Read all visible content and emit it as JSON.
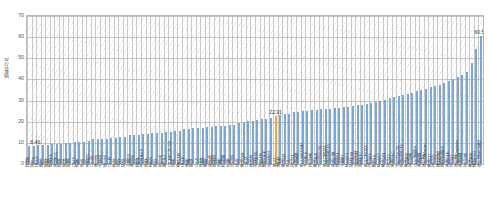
{
  "chart_data": {
    "type": "bar",
    "title": "",
    "xlabel": "",
    "ylabel": "销售万元",
    "ylim": [
      0,
      70
    ],
    "yticks": [
      0,
      10,
      20,
      30,
      40,
      50,
      60,
      70
    ],
    "grid": true,
    "legend": null,
    "bar_color": "#7ba7d7",
    "highlight_color": "#f0a24a",
    "highlight_index": 54,
    "annotations": [
      {
        "index": 0,
        "text": "8.46",
        "value": 8.46
      },
      {
        "index": 54,
        "text": "22.91",
        "value": 22.91
      },
      {
        "index": 99,
        "text": "60.50",
        "value": 60.5
      }
    ],
    "categories": [
      "瑞虎8",
      "宋Pro",
      "UNI-V",
      "朗逸",
      "缤智",
      "哈弗H6",
      "荣威RX5",
      "博越",
      "思域",
      "轩逸",
      "CS75",
      "逍客",
      "途岳",
      "名爵ZS",
      "CX-30",
      "锋兰达",
      "卡罗拉",
      "威兰达",
      "CH-R",
      "奕泽",
      "探影",
      "悦动",
      "小鹏G3",
      "领克06",
      "星越L",
      "长安UNI-T",
      "帝豪",
      "RAV4",
      "皓影",
      "高尔夫",
      "智己L7",
      "CS AIPCPCSS",
      "宝来",
      "秦PLUS",
      "UNI-K",
      "速腾",
      "明锐",
      "CX-5",
      "途观L",
      "雅阁",
      "帕萨特",
      "凯美瑞",
      "迈腾",
      "昂科威",
      "天籁",
      "汉兰达",
      "探岳",
      "奥迪Q2L",
      "CR-V",
      "亚洲龙",
      "蔚来ES6",
      "宋PLUS",
      "理想ONE",
      "比亚迪汉",
      "ID.4X",
      "唐DM",
      "奥迪Q3",
      "ID.3",
      "宝马X1",
      "奔驰A级",
      "ID.7 VIZZION",
      "大众ID.6",
      "宝马3系",
      "奥迪A4L",
      "沃尔沃XC60",
      "ID.6 CROZZ",
      "凯迪拉克CT5",
      "奔驰C级",
      "极氪001",
      "小鹏P7",
      "Model 3",
      "蔚来ES8",
      "比亚迪唐",
      "蔚来ET7",
      "ID.4 CROZZ",
      "宝马iX3",
      "理想L9",
      "Model Y",
      "奥迪Q5L",
      "宝马X3",
      "奔驰GLC",
      "沃尔沃XC90",
      "凯迪拉克CT6",
      "奥迪A6L",
      "宝马5系",
      "CLS 轿跑车",
      "奔驰E级",
      "保时捷Macan",
      "奥迪Q7",
      "宝马X5",
      "路虎揽胜",
      "雷克萨斯ES",
      "奔驰GLE",
      "宝马X7",
      "保时捷Cayenne",
      "奔驰S级",
      "宝马7系",
      "奥迪A8L",
      "路虎卫士",
      "保时捷帕拉梅拉"
    ],
    "values": [
      8.46,
      8.6,
      8.8,
      8.95,
      9.1,
      9.3,
      9.5,
      9.7,
      9.85,
      10.0,
      10.2,
      10.4,
      10.6,
      10.8,
      11.6,
      11.75,
      11.9,
      12.05,
      12.2,
      12.4,
      12.55,
      12.7,
      13.5,
      13.7,
      13.9,
      14.1,
      14.3,
      14.5,
      14.7,
      14.9,
      15.1,
      15.3,
      15.5,
      15.7,
      16.4,
      16.6,
      16.8,
      17.0,
      17.2,
      17.4,
      17.6,
      17.8,
      18.0,
      18.2,
      18.4,
      18.6,
      19.6,
      19.9,
      20.2,
      20.5,
      20.8,
      21.1,
      21.4,
      21.7,
      22.91,
      23.2,
      23.5,
      23.8,
      24.6,
      24.8,
      25.0,
      25.2,
      25.4,
      25.6,
      25.8,
      26.0,
      26.2,
      26.4,
      26.6,
      26.9,
      27.2,
      27.5,
      27.8,
      28.1,
      28.5,
      28.9,
      29.3,
      29.7,
      30.5,
      31.0,
      31.5,
      32.0,
      32.6,
      33.2,
      33.8,
      34.4,
      35.0,
      35.6,
      36.2,
      36.9,
      37.6,
      38.4,
      39.2,
      40.0,
      41.0,
      42.0,
      43.5,
      47.8,
      54.5,
      60.5
    ]
  }
}
